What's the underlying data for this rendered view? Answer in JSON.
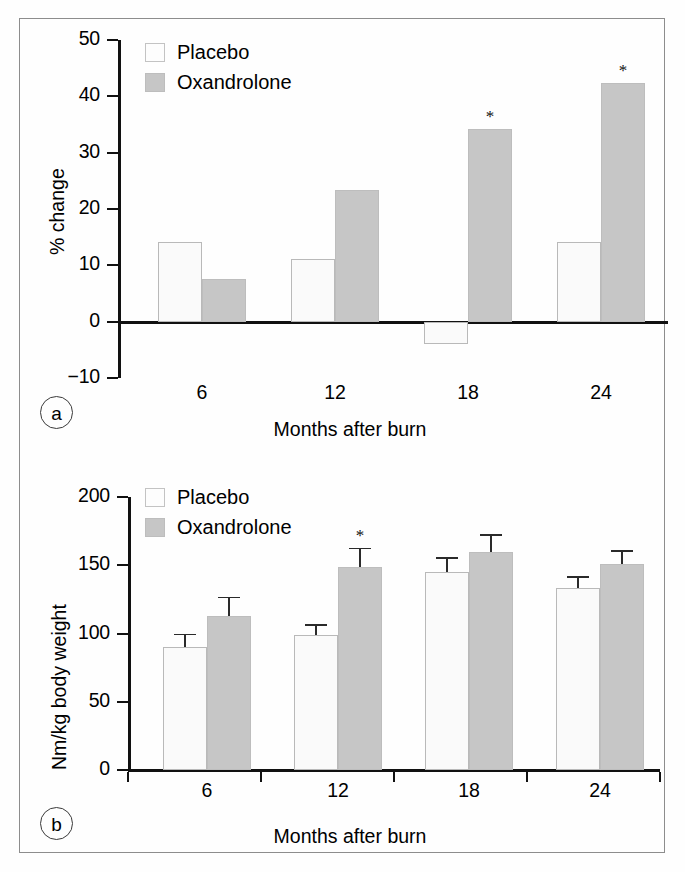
{
  "figure": {
    "panel_a_letter": "a",
    "panel_b_letter": "b"
  },
  "chart_data": [
    {
      "type": "bar",
      "panel": "a",
      "title": "",
      "xlabel": "Months after burn",
      "ylabel": "% change",
      "categories": [
        "6",
        "12",
        "18",
        "24"
      ],
      "ylim": [
        -10,
        50
      ],
      "yticks": [
        -10,
        0,
        10,
        20,
        30,
        40,
        50
      ],
      "ytick_labels": [
        "−10",
        "0",
        "10",
        "20",
        "30",
        "40",
        "50"
      ],
      "grid": false,
      "legend_position": "top-left",
      "series": [
        {
          "name": "Placebo",
          "color": "#fafafa",
          "values": [
            14.2,
            11.2,
            -4.0,
            14.2
          ],
          "significance": [
            "",
            "",
            "",
            ""
          ]
        },
        {
          "name": "Oxandrolone",
          "color": "#c6c6c6",
          "values": [
            7.5,
            23.3,
            34.2,
            42.3
          ],
          "significance": [
            "",
            "",
            "*",
            "*"
          ]
        }
      ],
      "annotations": [
        "*"
      ]
    },
    {
      "type": "bar",
      "panel": "b",
      "title": "",
      "xlabel": "Months after burn",
      "ylabel": "Nm/kg body weight",
      "categories": [
        "6",
        "12",
        "18",
        "24"
      ],
      "ylim": [
        0,
        200
      ],
      "yticks": [
        0,
        50,
        100,
        150,
        200
      ],
      "ytick_labels": [
        "0",
        "50",
        "100",
        "150",
        "200"
      ],
      "grid": false,
      "legend_position": "top-left",
      "error_bars": "upper",
      "series": [
        {
          "name": "Placebo",
          "color": "#fafafa",
          "values": [
            90,
            99,
            145,
            133
          ],
          "errors": [
            10,
            8,
            11,
            9
          ],
          "significance": [
            "",
            "",
            "",
            ""
          ]
        },
        {
          "name": "Oxandrolone",
          "color": "#c6c6c6",
          "values": [
            113,
            149,
            160,
            151
          ],
          "errors": [
            14,
            14,
            13,
            10
          ],
          "significance": [
            "",
            "*",
            "",
            ""
          ]
        }
      ],
      "annotations": [
        "*"
      ]
    }
  ]
}
